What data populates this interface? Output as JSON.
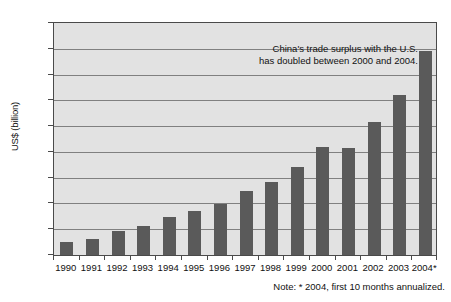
{
  "chart_data": {
    "type": "bar",
    "title": "",
    "xlabel": "",
    "ylabel": "US$ (billion)",
    "categories": [
      "1990",
      "1991",
      "1992",
      "1993",
      "1994",
      "1995",
      "1996",
      "1997",
      "1998",
      "1999",
      "2000",
      "2001",
      "2002",
      "2003",
      "2004*"
    ],
    "values": [
      10.4,
      12.7,
      18.3,
      22.8,
      29.5,
      33.8,
      39.5,
      49.7,
      56.9,
      68.7,
      83.8,
      83.1,
      103.1,
      124.0,
      158.0
    ],
    "ylim": [
      0,
      180
    ],
    "ytick_step": 20,
    "yticks": [
      "180",
      "160",
      "140",
      "120",
      "100",
      "80",
      "60",
      "40",
      "20",
      "0"
    ],
    "grid": true,
    "legend": "none",
    "annotations": [
      "China's trade surplus with the U.S.",
      "has doubled between 2000 and 2004."
    ],
    "footnote": "Note:  * 2004, first 10 months annualized.",
    "colors": {
      "bar_fill": "#5a5a5a",
      "plot_background": "#e2e2e2",
      "gridline": "#808080",
      "axis": "#4a4a4a",
      "text": "#111111",
      "page_background": "#ffffff"
    }
  }
}
